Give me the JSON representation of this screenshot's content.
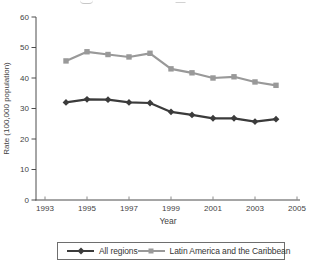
{
  "chart_data": {
    "type": "line",
    "title": "",
    "xlabel": "Year",
    "ylabel": "Rate (100,000 population)",
    "x": [
      1994,
      1995,
      1996,
      1997,
      1998,
      1999,
      2000,
      2001,
      2002,
      2003,
      2004
    ],
    "series": [
      {
        "name": "All regions",
        "marker": "diamond",
        "color": "#3b3b3b",
        "values": [
          32.0,
          33.0,
          32.9,
          32.0,
          31.8,
          28.9,
          27.9,
          26.8,
          26.8,
          25.7,
          26.5
        ]
      },
      {
        "name": "Latin America and the Caribbean",
        "marker": "square",
        "color": "#999999",
        "values": [
          45.6,
          48.6,
          47.7,
          46.9,
          48.1,
          43.0,
          41.7,
          40.0,
          40.4,
          38.7,
          37.6
        ]
      }
    ],
    "xlim": [
      1993,
      2005
    ],
    "ylim": [
      0,
      60
    ],
    "x_ticks": [
      1993,
      1995,
      1997,
      1999,
      2001,
      2003,
      2005
    ],
    "y_ticks": [
      0,
      10,
      20,
      30,
      40,
      50,
      60
    ],
    "grid": false,
    "legend_position": "bottom",
    "axis_color": "#4c4c4c",
    "tick_color": "#8a8a8a",
    "text_color": "#3f3f3f"
  }
}
